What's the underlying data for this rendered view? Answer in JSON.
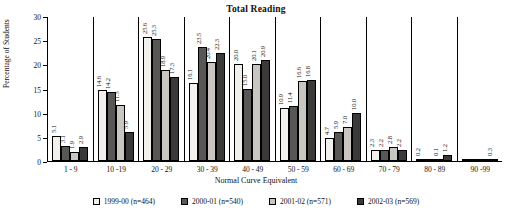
{
  "chart_data": {
    "type": "bar",
    "title": "Total Reading",
    "xlabel": "Normal Curve Equivalent",
    "ylabel": "Percentage of Students",
    "ylim": [
      0,
      30
    ],
    "yticks": [
      0,
      5,
      10,
      15,
      20,
      25,
      30
    ],
    "grid": false,
    "legend_position": "bottom",
    "categories": [
      "1 - 9",
      "10 -19",
      "20 - 29",
      "30 - 39",
      "40 - 49",
      "50 - 59",
      "60 - 69",
      "70 - 79",
      "80 - 89",
      "90 -99"
    ],
    "series": [
      {
        "name": "1999-00 (n=464)",
        "color": "#f2f0ec",
        "values": [
          5.1,
          14.6,
          25.6,
          16.1,
          20.0,
          10.9,
          4.7,
          2.3,
          0.2,
          0.0
        ]
      },
      {
        "name": "2000-01 (n=540)",
        "color": "#595755",
        "values": [
          3.1,
          14.2,
          25.3,
          23.5,
          15.0,
          11.4,
          5.9,
          2.2,
          0.0,
          0.0
        ]
      },
      {
        "name": "2001-02 (n=571)",
        "color": "#c9c6c1",
        "values": [
          1.9,
          11.5,
          18.9,
          20.4,
          20.1,
          16.6,
          7.0,
          2.8,
          0.1,
          0.0
        ]
      },
      {
        "name": "2002-03 (n=569)",
        "color": "#3c3a38",
        "values": [
          2.9,
          5.9,
          17.3,
          22.3,
          20.9,
          16.8,
          10.0,
          2.2,
          1.2,
          0.3
        ]
      }
    ],
    "value_labels": {
      "1 - 9": [
        "5.1",
        "3.1",
        "1.9",
        "2.9"
      ],
      "10 -19": [
        "14.6",
        "14.2",
        "11.5",
        "5.9"
      ],
      "20 - 29": [
        "25.6",
        "25.3",
        "18.9",
        "17.3"
      ],
      "30 - 39": [
        "16.1",
        "23.5",
        "20.4",
        "22.3"
      ],
      "40 - 49": [
        "20.0",
        "15.0",
        "20.1",
        "20.9"
      ],
      "50 - 59": [
        "10.9",
        "11.4",
        "16.6",
        "16.8"
      ],
      "60 - 69": [
        "4.7",
        "5.9",
        "7.0",
        "10.0"
      ],
      "70 - 79": [
        "2.3",
        "2.2",
        "2.8",
        "2.2"
      ],
      "80 - 89": [
        "0.2",
        "",
        "0.1",
        "1.2"
      ],
      "90 -99": [
        "",
        "",
        "",
        "0.3"
      ]
    }
  },
  "legend": {
    "items": [
      {
        "label": "1999-00 (n=464)",
        "color": "#f2f0ec"
      },
      {
        "label": "2000-01 (n=540)",
        "color": "#595755"
      },
      {
        "label": "2001-02 (n=571)",
        "color": "#c9c6c1"
      },
      {
        "label": "2002-03 (n=569)",
        "color": "#3c3a38"
      }
    ]
  }
}
